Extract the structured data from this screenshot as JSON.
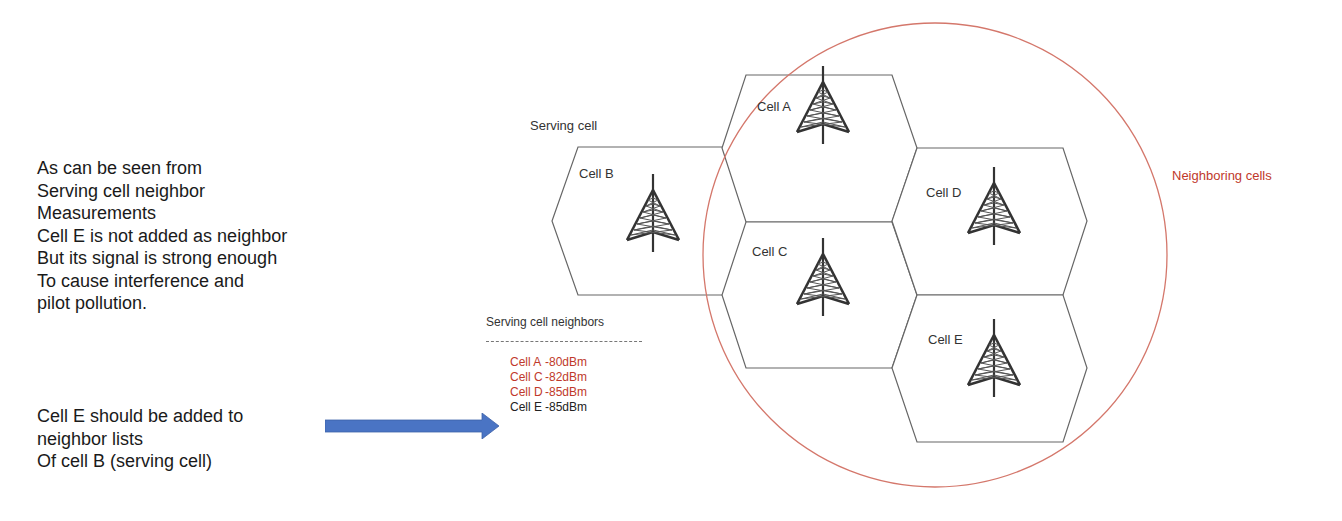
{
  "explanation": {
    "lines": [
      "As can be seen from",
      "Serving cell neighbor",
      "Measurements",
      "Cell E is not added as neighbor",
      "But its signal is strong enough",
      "To cause interference and",
      "pilot pollution."
    ]
  },
  "conclusion": {
    "lines": [
      "Cell E should be added to",
      "neighbor lists",
      "Of cell B (serving cell)"
    ]
  },
  "diagram": {
    "serving_cell_label": "Serving cell",
    "neighboring_cells_label": "Neighboring cells",
    "cells": [
      {
        "name": "Cell A",
        "icon": "cell-tower-icon"
      },
      {
        "name": "Cell B",
        "icon": "cell-tower-icon"
      },
      {
        "name": "Cell C",
        "icon": "cell-tower-icon"
      },
      {
        "name": "Cell D",
        "icon": "cell-tower-icon"
      },
      {
        "name": "Cell E",
        "icon": "cell-tower-icon"
      }
    ],
    "colors": {
      "neighbor_circle": "#d4776b",
      "neighbor_text": "#c0392b",
      "arrow": "#4a74c4",
      "hex_stroke": "#555555"
    }
  },
  "neighbor_list": {
    "title": "Serving cell neighbors",
    "rows": [
      {
        "cell": "Cell A",
        "level": "-80dBm",
        "status": "listed"
      },
      {
        "cell": "Cell C",
        "level": "-82dBm",
        "status": "listed"
      },
      {
        "cell": "Cell D",
        "level": "-85dBm",
        "status": "listed"
      },
      {
        "cell": "Cell E",
        "level": "-85dBm",
        "status": "missing"
      }
    ]
  }
}
